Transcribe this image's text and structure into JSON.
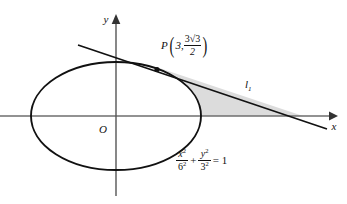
{
  "figure": {
    "background_color": "#ffffff",
    "stroke_color": "#111111",
    "axis_color": "#6e6e6e",
    "shade_color": "#d9d9d9"
  },
  "axes": {
    "x_label": "x",
    "y_label": "y",
    "origin_label": "O",
    "x_axis_start_px": 0,
    "x_axis_end_px": 332,
    "y_axis_top_px": 18,
    "y_axis_bottom_px": 196,
    "origin_px": {
      "x": 116,
      "y": 116
    }
  },
  "ellipse": {
    "equation": {
      "x_num": "x",
      "x_num_sup": "2",
      "x_den": "6",
      "x_den_sup": "2",
      "plus": "+",
      "y_num": "y",
      "y_num_sup": "2",
      "y_den": "3",
      "y_den_sup": "2",
      "equals": "= 1"
    },
    "semi_major_a": 6,
    "semi_minor_b": 3,
    "center_px": {
      "x": 116,
      "y": 116
    },
    "rx_px": 85,
    "ry_px": 54
  },
  "point_P": {
    "name": "P",
    "open_paren": "(",
    "close_paren": ")",
    "x_value": "3,",
    "y_numerator": "3",
    "y_radical": "√3",
    "y_denominator": "2",
    "dot_px": {
      "x": 157,
      "y": 70
    }
  },
  "tangent_line": {
    "label": "l",
    "label_subscript": "1",
    "start_px": {
      "x": 78,
      "y": 45
    },
    "end_px": {
      "x": 327,
      "y": 129
    },
    "label_px": {
      "x": 248,
      "y": 84
    }
  },
  "shaded_region": {
    "description": "region bounded by ellipse arc, tangent line and x-axis",
    "fill": "#dcdcdc",
    "right_vertex_px": {
      "x": 303,
      "y": 116
    }
  }
}
